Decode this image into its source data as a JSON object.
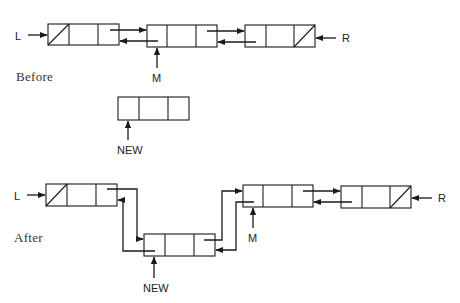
{
  "diagram": {
    "type": "doubly-linked-list-insertion",
    "before": {
      "caption": "Before",
      "pointer_labels": {
        "left": "L",
        "right": "R",
        "middle": "M"
      },
      "nodes": [
        "left-end",
        "M",
        "right-end"
      ]
    },
    "new_node": {
      "label": "NEW"
    },
    "after": {
      "caption": "After",
      "pointer_labels": {
        "left": "L",
        "right": "R",
        "middle": "M",
        "new": "NEW"
      },
      "nodes": [
        "left-end",
        "NEW",
        "M",
        "right-end"
      ]
    }
  }
}
